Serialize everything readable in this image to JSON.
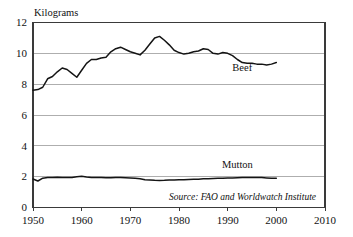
{
  "chart_data": {
    "type": "line",
    "title": "",
    "ylabel": "Kilograms",
    "xlabel": "",
    "xlim": [
      1950,
      2010
    ],
    "ylim": [
      0,
      12
    ],
    "grid": true,
    "legend_position": "inline-right",
    "yticks": [
      "0",
      "2",
      "4",
      "6",
      "8",
      "10",
      "12"
    ],
    "ytick_values": [
      0,
      2,
      4,
      6,
      8,
      10,
      12
    ],
    "xticks": [
      "1950",
      "1960",
      "1970",
      "1980",
      "1990",
      "2000",
      "2010"
    ],
    "xtick_values": [
      1950,
      1960,
      1970,
      1980,
      1990,
      2000,
      2010
    ],
    "annotation": "Source: FAO and Worldwatch Institute",
    "line_color": "#141414",
    "grid_color": "#9a9a9a",
    "frame_color": "#3a3a3a",
    "series": [
      {
        "name": "Beef",
        "label": "Beef",
        "label_year": 1993,
        "label_value": 8.85,
        "x": [
          1950,
          1951,
          1952,
          1953,
          1954,
          1955,
          1956,
          1957,
          1958,
          1959,
          1960,
          1961,
          1962,
          1963,
          1964,
          1965,
          1966,
          1967,
          1968,
          1969,
          1970,
          1971,
          1972,
          1973,
          1974,
          1975,
          1976,
          1977,
          1978,
          1979,
          1980,
          1981,
          1982,
          1983,
          1984,
          1985,
          1986,
          1987,
          1988,
          1989,
          1990,
          1991,
          1992,
          1993,
          1994,
          1995,
          1996,
          1997,
          1998,
          1999,
          2000
        ],
        "values": [
          7.6,
          7.65,
          7.8,
          8.35,
          8.5,
          8.8,
          9.05,
          8.95,
          8.7,
          8.45,
          8.9,
          9.35,
          9.6,
          9.6,
          9.7,
          9.75,
          10.1,
          10.3,
          10.4,
          10.25,
          10.1,
          10.0,
          9.9,
          10.2,
          10.6,
          11.0,
          11.1,
          10.85,
          10.55,
          10.2,
          10.05,
          9.95,
          10.0,
          10.1,
          10.15,
          10.3,
          10.25,
          10.0,
          9.95,
          10.05,
          10.0,
          9.85,
          9.6,
          9.4,
          9.35,
          9.35,
          9.3,
          9.3,
          9.25,
          9.3,
          9.4
        ]
      },
      {
        "name": "Mutton",
        "label": "Mutton",
        "label_year": 1992,
        "label_value": 2.55,
        "x": [
          1950,
          1951,
          1952,
          1953,
          1954,
          1955,
          1956,
          1957,
          1958,
          1959,
          1960,
          1961,
          1962,
          1963,
          1964,
          1965,
          1966,
          1967,
          1968,
          1969,
          1970,
          1971,
          1972,
          1973,
          1974,
          1975,
          1976,
          1977,
          1978,
          1979,
          1980,
          1981,
          1982,
          1983,
          1984,
          1985,
          1986,
          1987,
          1988,
          1989,
          1990,
          1991,
          1992,
          1993,
          1994,
          1995,
          1996,
          1997,
          1998,
          1999,
          2000
        ],
        "values": [
          1.85,
          1.72,
          1.9,
          1.95,
          1.95,
          1.96,
          1.95,
          1.94,
          1.95,
          2.0,
          2.02,
          1.98,
          1.95,
          1.95,
          1.94,
          1.93,
          1.93,
          1.94,
          1.94,
          1.93,
          1.92,
          1.9,
          1.87,
          1.8,
          1.78,
          1.76,
          1.75,
          1.76,
          1.78,
          1.79,
          1.8,
          1.8,
          1.82,
          1.83,
          1.84,
          1.86,
          1.87,
          1.88,
          1.89,
          1.9,
          1.91,
          1.92,
          1.93,
          1.94,
          1.95,
          1.95,
          1.95,
          1.94,
          1.92,
          1.9,
          1.9
        ]
      }
    ]
  }
}
